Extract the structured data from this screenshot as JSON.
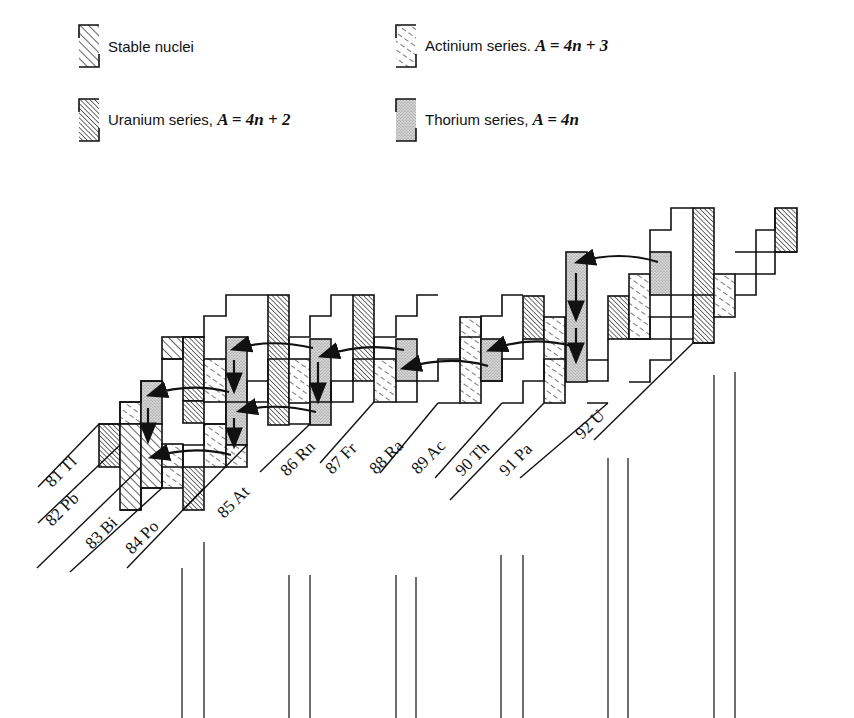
{
  "legend": {
    "stable": {
      "label": "Stable nuclei",
      "pattern": "stable"
    },
    "actinium": {
      "label": "Actinium series. ",
      "formula": "A = 4n + 3",
      "pattern": "actinium"
    },
    "uranium": {
      "label": "Uranium series, ",
      "formula": "A = 4n + 2",
      "pattern": "uranium"
    },
    "thorium": {
      "label": "Thorium series, ",
      "formula": "A = 4n",
      "pattern": "thorium"
    }
  },
  "elements": [
    {
      "z": 81,
      "symbol": "Tl",
      "label": "81 Tl"
    },
    {
      "z": 82,
      "symbol": "Pb",
      "label": "82 Pb"
    },
    {
      "z": 83,
      "symbol": "Bi",
      "label": "83 Bi"
    },
    {
      "z": 84,
      "symbol": "Po",
      "label": "84 Po"
    },
    {
      "z": 85,
      "symbol": "At",
      "label": "85 At"
    },
    {
      "z": 86,
      "symbol": "Rn",
      "label": "86 Rn"
    },
    {
      "z": 87,
      "symbol": "Fr",
      "label": "87 Fr"
    },
    {
      "z": 88,
      "symbol": "Ra",
      "label": "88 Ra"
    },
    {
      "z": 89,
      "symbol": "Ac",
      "label": "89 Ac"
    },
    {
      "z": 90,
      "symbol": "Th",
      "label": "90 Th"
    },
    {
      "z": 91,
      "symbol": "Pa",
      "label": "91 Pa"
    },
    {
      "z": 92,
      "symbol": "U",
      "label": "92 U"
    }
  ],
  "colors": {
    "ink": "#111111",
    "thorium_stipple": "#bdbdbd",
    "background": "#ffffff"
  }
}
